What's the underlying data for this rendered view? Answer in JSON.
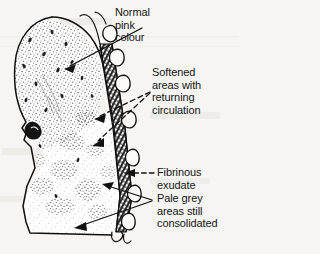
{
  "figure": {
    "background_color": "#f6f5f3",
    "ink_color": "#151515",
    "labels": [
      {
        "id": "normal-pink-colour",
        "lines": [
          "Normal",
          "pink",
          "colour"
        ],
        "text": "Normal pink colour",
        "pointer": "solid-arrow",
        "points_to": "upper-lobe-normal-tissue"
      },
      {
        "id": "softened-areas",
        "lines": [
          "Softened",
          "areas with",
          "returning",
          "circulation"
        ],
        "text": "Softened areas with returning circulation",
        "pointer": "dashed-arrows",
        "points_to": "softened-patches"
      },
      {
        "id": "fibrinous-exudate",
        "lines": [
          "Fibrinous",
          "exudate"
        ],
        "text": "Fibrinous exudate",
        "pointer": "dashed-arrow",
        "points_to": "pleural-exudate-band"
      },
      {
        "id": "pale-grey-consolidated",
        "lines": [
          "Pale grey",
          "areas still",
          "consolidated"
        ],
        "text": "Pale grey areas still consolidated",
        "pointer": "solid-arrows",
        "points_to": "lower-lobe-grey-areas"
      }
    ],
    "regions": {
      "upper_lobe": "densely stippled normal pink lung apex",
      "lower_lobe": "pale grey consolidated lung with patchy softened areas",
      "hilum": "dark bronchus / vessel opening at mid-left notch",
      "pleural_edge": "dark cross-hatched fibrinous exudate band with bulging loops along right border"
    }
  }
}
